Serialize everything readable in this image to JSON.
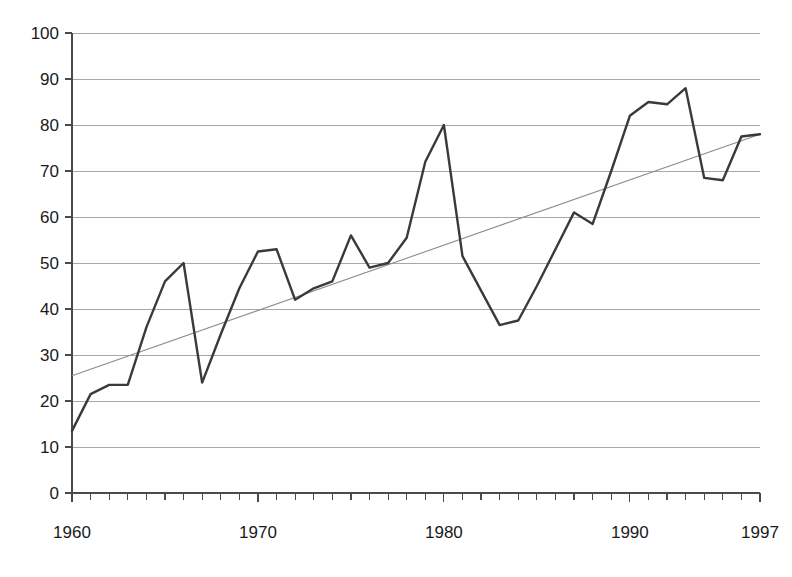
{
  "chart_data": {
    "type": "line",
    "title": "",
    "subtitle": "",
    "xlabel": "",
    "ylabel": "",
    "xlim": [
      1960,
      1997
    ],
    "ylim": [
      0,
      100
    ],
    "grid": true,
    "legend": "none",
    "x": [
      1960,
      1961,
      1962,
      1963,
      1964,
      1965,
      1966,
      1967,
      1968,
      1969,
      1970,
      1971,
      1972,
      1973,
      1974,
      1975,
      1976,
      1977,
      1978,
      1979,
      1980,
      1981,
      1982,
      1983,
      1984,
      1985,
      1986,
      1987,
      1988,
      1989,
      1990,
      1991,
      1992,
      1993,
      1994,
      1995,
      1996,
      1997
    ],
    "x_tick_labels": [
      "1960",
      "1970",
      "1980",
      "1990",
      "1997"
    ],
    "x_tick_values": [
      1960,
      1970,
      1980,
      1990,
      1997
    ],
    "y_tick_labels": [
      "0",
      "10",
      "20",
      "30",
      "40",
      "50",
      "60",
      "70",
      "80",
      "90",
      "100"
    ],
    "y_tick_values": [
      0,
      10,
      20,
      30,
      40,
      50,
      60,
      70,
      80,
      90,
      100
    ],
    "series": [
      {
        "name": "data",
        "color": "#3a3a3a",
        "values": [
          13.5,
          21.5,
          23.5,
          23.5,
          36.0,
          46.0,
          50.0,
          24.0,
          34.5,
          44.5,
          52.5,
          53.0,
          42.0,
          44.5,
          46.0,
          56.0,
          49.0,
          50.0,
          55.5,
          72.0,
          80.0,
          51.5,
          44.0,
          36.5,
          37.5,
          45.0,
          53.0,
          61.0,
          58.5,
          70.0,
          82.0,
          85.0,
          84.5,
          88.0,
          68.5,
          68.0,
          77.5,
          78.0
        ]
      },
      {
        "name": "trend",
        "color": "#8d8d8d",
        "type": "linear-trend",
        "endpoints": [
          {
            "x": 1960,
            "y": 25.5
          },
          {
            "x": 1997,
            "y": 78.0
          }
        ]
      }
    ]
  }
}
